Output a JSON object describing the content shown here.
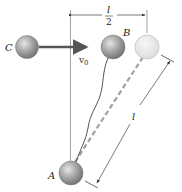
{
  "diagram": {
    "labels": {
      "ball_c": "C",
      "ball_b": "B",
      "ball_a": "A",
      "velocity": "v",
      "velocity_sub": "0",
      "half_length_num": "l",
      "half_length_den": "2",
      "length": "l"
    },
    "colors": {
      "ball_fill": "#8f8f8f",
      "ghost_ball_fill": "#e4e4e4",
      "arrow": "#555555",
      "line": "#666666",
      "dashed": "#9a9a9a"
    }
  }
}
